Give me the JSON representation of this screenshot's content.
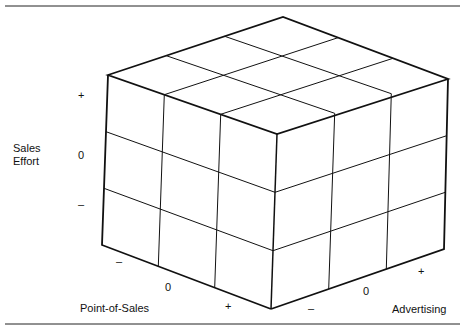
{
  "diagram": {
    "type": "3x3x3 cube",
    "axes": {
      "vertical": {
        "label_line1": "Sales",
        "label_line2": "Effort",
        "ticks": [
          "+",
          "0",
          "–"
        ]
      },
      "left_depth": {
        "label": "Point-of-Sales",
        "ticks": [
          "–",
          "0",
          "+"
        ]
      },
      "right_depth": {
        "label": "Advertising",
        "ticks": [
          "–",
          "0",
          "+"
        ]
      }
    }
  }
}
